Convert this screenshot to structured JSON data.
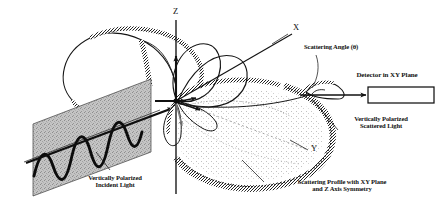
{
  "figure": {
    "background_color": "#ffffff",
    "ink_color": "#121212",
    "plane_fill_color": "#bdbdbd",
    "stipple_color": "#2a2a2a"
  },
  "axes": [
    {
      "name": "z-axis",
      "label": "Z",
      "direction": "up"
    },
    {
      "name": "x-axis",
      "label": "X",
      "direction": "upper-right"
    },
    {
      "name": "y-axis",
      "label": "Y",
      "direction": "lower-right"
    }
  ],
  "axis_labels": {
    "z": "Z",
    "x": "X",
    "y": "Y"
  },
  "annotations": {
    "scattering_angle": "Scattering Angle (θ)",
    "detector": "Detector in XY Plane",
    "scattered_light": "Vertically Polarized\nScattered Light",
    "incident_light": "Vertically Polarized\nIncident Light",
    "scattering_profile": "Scattering Profile with XY Plane\nand Z Axis Symmetry"
  },
  "symbols": {
    "theta": "θ"
  },
  "elements": {
    "detector_box": "detector-rectangle",
    "incident_plane": "vertically-polarized-incident-plane",
    "incident_wave": "sine-wave",
    "scattering_lobe_front": "large-stippled-lobe",
    "scattering_lobe_back": "back-stippled-lobe",
    "origin": "scattering-origin"
  }
}
